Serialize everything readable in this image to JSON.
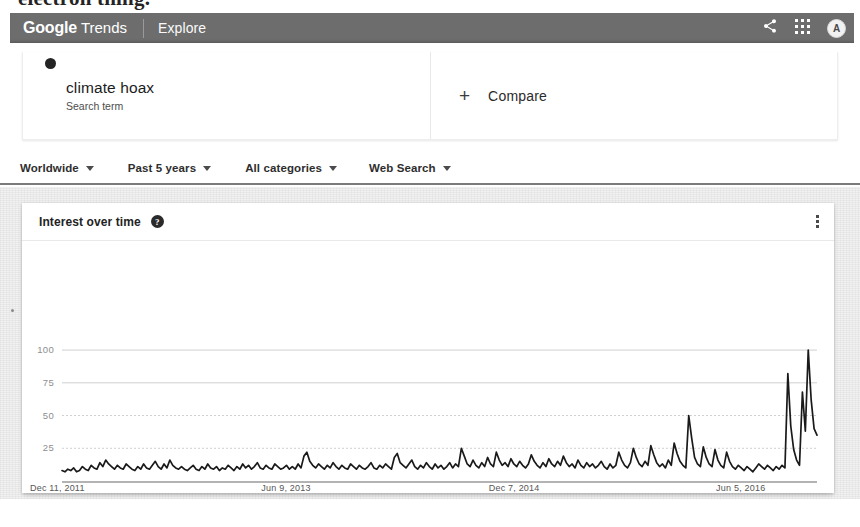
{
  "scan_artifact": {
    "clipped_line": "electron thing."
  },
  "appbar": {
    "brand_primary": "Google",
    "brand_secondary": "Trends",
    "explore_label": "Explore",
    "share_icon": "share-icon",
    "apps_icon": "apps-grid-icon",
    "avatar_initial": "A",
    "background": "#6d6d6d"
  },
  "query": {
    "term": "climate hoax",
    "term_type": "Search term",
    "dot_color": "#242424",
    "compare_label": "Compare",
    "compare_icon": "plus-icon"
  },
  "filters": [
    {
      "label": "Worldwide",
      "icon": "chevron-down-icon"
    },
    {
      "label": "Past 5 years",
      "icon": "chevron-down-icon"
    },
    {
      "label": "All categories",
      "icon": "chevron-down-icon"
    },
    {
      "label": "Web Search",
      "icon": "chevron-down-icon"
    }
  ],
  "card": {
    "title": "Interest over time",
    "help_icon": "help-question-icon",
    "menu_icon": "more-vertical-icon"
  },
  "chart_data": {
    "type": "line",
    "title": "Interest over time",
    "xlabel": "",
    "ylabel": "",
    "ylim": [
      0,
      110
    ],
    "yticks": [
      25,
      50,
      75,
      100
    ],
    "grid": true,
    "legend": "none",
    "line_color": "#1a1a1a",
    "series_name": "climate hoax",
    "xticks": [
      "Dec 11, 2011",
      "Jun 9, 2013",
      "Dec 7, 2014",
      "Jun 5, 2016"
    ],
    "xtick_index": [
      0,
      78,
      156,
      234
    ],
    "x_start": "Dec 11, 2011",
    "x_end": "Dec 2016",
    "n_points": 261,
    "values": [
      8,
      7,
      9,
      8,
      10,
      7,
      8,
      11,
      9,
      8,
      12,
      10,
      9,
      14,
      11,
      16,
      13,
      11,
      9,
      12,
      10,
      9,
      13,
      11,
      9,
      8,
      11,
      9,
      13,
      10,
      9,
      12,
      15,
      11,
      9,
      13,
      10,
      16,
      12,
      10,
      9,
      11,
      9,
      8,
      10,
      12,
      9,
      8,
      11,
      9,
      13,
      10,
      9,
      11,
      8,
      10,
      9,
      12,
      10,
      8,
      11,
      9,
      13,
      10,
      12,
      9,
      11,
      14,
      10,
      9,
      12,
      10,
      9,
      13,
      11,
      9,
      10,
      12,
      9,
      11,
      9,
      13,
      10,
      19,
      22,
      15,
      12,
      10,
      13,
      11,
      9,
      12,
      10,
      14,
      11,
      9,
      12,
      10,
      9,
      13,
      11,
      9,
      12,
      10,
      9,
      11,
      14,
      10,
      9,
      12,
      10,
      13,
      11,
      9,
      18,
      21,
      14,
      12,
      10,
      13,
      16,
      11,
      9,
      12,
      10,
      14,
      11,
      9,
      13,
      10,
      12,
      9,
      11,
      14,
      10,
      13,
      11,
      25,
      19,
      13,
      11,
      16,
      12,
      10,
      14,
      11,
      18,
      13,
      11,
      22,
      16,
      12,
      14,
      11,
      17,
      13,
      11,
      15,
      12,
      10,
      13,
      20,
      15,
      12,
      10,
      14,
      11,
      17,
      13,
      11,
      15,
      12,
      19,
      14,
      11,
      13,
      10,
      16,
      12,
      10,
      14,
      11,
      13,
      10,
      12,
      15,
      11,
      9,
      13,
      10,
      12,
      22,
      16,
      12,
      10,
      14,
      25,
      18,
      13,
      11,
      15,
      12,
      27,
      20,
      14,
      11,
      13,
      10,
      16,
      12,
      29,
      21,
      15,
      12,
      10,
      50,
      33,
      18,
      13,
      11,
      26,
      18,
      13,
      11,
      24,
      16,
      12,
      10,
      22,
      15,
      11,
      9,
      12,
      10,
      8,
      11,
      9,
      7,
      10,
      13,
      11,
      9,
      12,
      10,
      8,
      11,
      9,
      12,
      10,
      82,
      42,
      24,
      16,
      12,
      68,
      38,
      100,
      62,
      40,
      35
    ],
    "peaks": [
      {
        "value": 100,
        "note": "highest point"
      },
      {
        "value": 82,
        "note": "secondary spike"
      },
      {
        "value": 68,
        "note": "tertiary spike"
      },
      {
        "value": 50,
        "note": "mid-period spike"
      }
    ]
  }
}
